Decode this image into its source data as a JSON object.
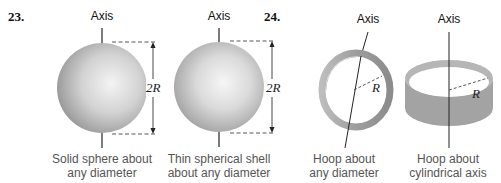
{
  "problems": [
    {
      "number": "23.",
      "items": [
        {
          "axis_label": "Axis",
          "dimension": "2R",
          "caption_line1": "Solid sphere about",
          "caption_line2": "any diameter"
        },
        {
          "axis_label": "Axis",
          "dimension": "2R",
          "caption_line1": "Thin spherical shell",
          "caption_line2": "about any diameter"
        }
      ]
    },
    {
      "number": "24.",
      "items": [
        {
          "axis_label": "Axis",
          "dimension": "R",
          "caption_line1": "Hoop about",
          "caption_line2": "any diameter"
        },
        {
          "axis_label": "Axis",
          "dimension": "R",
          "caption_line1": "Hoop about",
          "caption_line2": "cylindrical axis"
        }
      ]
    }
  ],
  "colors": {
    "sphere_light": "#f2f2f2",
    "sphere_dark": "#9a9a9a",
    "hoop": "#a8a8a8",
    "caption": "#555555",
    "line": "#222222"
  }
}
